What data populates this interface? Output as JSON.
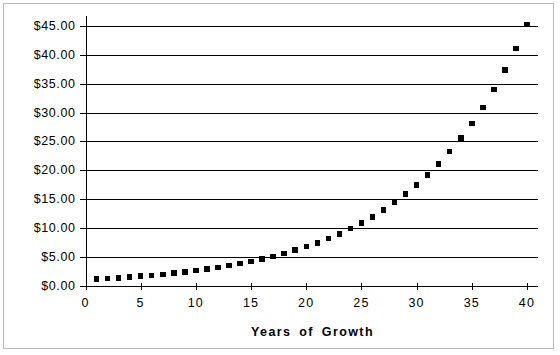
{
  "chart_data": {
    "type": "scatter",
    "title": "",
    "xlabel": "Years of Growth",
    "ylabel": "",
    "xlim": [
      0,
      41
    ],
    "ylim": [
      0,
      47
    ],
    "grid": true,
    "legend": false,
    "marker": "filled-square",
    "marker_color": "#000000",
    "x_ticks": [
      "0",
      "5",
      "10",
      "15",
      "20",
      "25",
      "30",
      "35",
      "40"
    ],
    "x_tick_values": [
      0,
      5,
      10,
      15,
      20,
      25,
      30,
      35,
      40
    ],
    "y_ticks": [
      "$0.00",
      "$5.00",
      "$10.00",
      "$15.00",
      "$20.00",
      "$25.00",
      "$30.00",
      "$35.00",
      "$40.00",
      "$45.00"
    ],
    "y_tick_values": [
      0,
      5,
      10,
      15,
      20,
      25,
      30,
      35,
      40,
      45
    ],
    "x": [
      1,
      2,
      3,
      4,
      5,
      6,
      7,
      8,
      9,
      10,
      11,
      12,
      13,
      14,
      15,
      16,
      17,
      18,
      19,
      20,
      21,
      22,
      23,
      24,
      25,
      26,
      27,
      28,
      29,
      30,
      31,
      32,
      33,
      34,
      35,
      36,
      37,
      38,
      39,
      40
    ],
    "values": [
      1.1,
      1.21,
      1.33,
      1.46,
      1.61,
      1.77,
      1.95,
      2.14,
      2.36,
      2.59,
      2.85,
      3.14,
      3.45,
      3.8,
      4.18,
      4.59,
      5.05,
      5.56,
      6.12,
      6.73,
      7.4,
      8.14,
      8.95,
      9.85,
      10.83,
      11.92,
      13.11,
      14.42,
      15.86,
      17.45,
      19.19,
      21.11,
      23.23,
      25.55,
      28.1,
      30.91,
      34.0,
      37.4,
      41.14,
      45.26
    ]
  },
  "axis": {
    "title": "Years of Growth"
  }
}
